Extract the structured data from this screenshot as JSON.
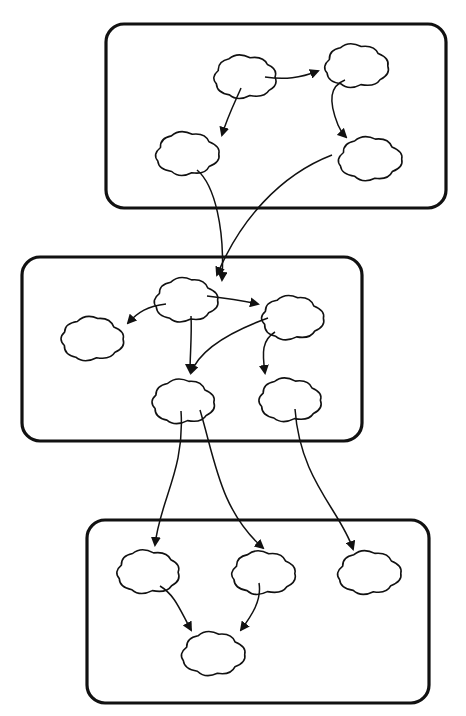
{
  "diagram": {
    "type": "layered-cloud-graph",
    "colors": {
      "stroke": "#111111",
      "background": "#ffffff"
    },
    "groups": [
      {
        "id": "top",
        "x": 106,
        "y": 24,
        "w": 340,
        "h": 184,
        "r": 18
      },
      {
        "id": "middle",
        "x": 22,
        "y": 257,
        "w": 340,
        "h": 184,
        "r": 18
      },
      {
        "id": "bottom",
        "x": 87,
        "y": 520,
        "w": 342,
        "h": 183,
        "r": 18
      }
    ],
    "nodes": [
      {
        "id": "t1",
        "group": "top",
        "cx": 245,
        "cy": 77,
        "rx": 35,
        "ry": 25
      },
      {
        "id": "t2",
        "group": "top",
        "cx": 356,
        "cy": 66,
        "rx": 35,
        "ry": 25
      },
      {
        "id": "t3",
        "group": "top",
        "cx": 187,
        "cy": 154,
        "rx": 35,
        "ry": 25
      },
      {
        "id": "t4",
        "group": "top",
        "cx": 370,
        "cy": 159,
        "rx": 35,
        "ry": 25
      },
      {
        "id": "m1",
        "group": "middle",
        "cx": 186,
        "cy": 300,
        "rx": 35,
        "ry": 25
      },
      {
        "id": "m2",
        "group": "middle",
        "cx": 292,
        "cy": 318,
        "rx": 35,
        "ry": 25
      },
      {
        "id": "m3",
        "group": "middle",
        "cx": 92,
        "cy": 339,
        "rx": 35,
        "ry": 25
      },
      {
        "id": "m4",
        "group": "middle",
        "cx": 183,
        "cy": 402,
        "rx": 35,
        "ry": 25
      },
      {
        "id": "m5",
        "group": "middle",
        "cx": 290,
        "cy": 400,
        "rx": 35,
        "ry": 25
      },
      {
        "id": "b1",
        "group": "bottom",
        "cx": 148,
        "cy": 572,
        "rx": 35,
        "ry": 25
      },
      {
        "id": "b2",
        "group": "bottom",
        "cx": 263,
        "cy": 573,
        "rx": 35,
        "ry": 25
      },
      {
        "id": "b3",
        "group": "bottom",
        "cx": 369,
        "cy": 573,
        "rx": 35,
        "ry": 25
      },
      {
        "id": "b4",
        "group": "bottom",
        "cx": 213,
        "cy": 654,
        "rx": 35,
        "ry": 25
      }
    ],
    "edges": [
      {
        "from": "t1",
        "to": "t2",
        "d": "M265,77 C285,80 300,78 318,71"
      },
      {
        "from": "t1",
        "to": "t3",
        "d": "M241,88 C236,100 228,115 222,135"
      },
      {
        "from": "t2",
        "to": "t4",
        "d": "M345,80 C330,86 328,100 338,125 C340,130 343,134 346,137"
      },
      {
        "from": "t3",
        "to": "m1",
        "d": "M197,170 C215,185 225,230 222,280"
      },
      {
        "from": "t4",
        "to": "m1",
        "d": "M332,155 C280,175 240,220 217,275"
      },
      {
        "from": "m1",
        "to": "m2",
        "d": "M207,296 C225,298 240,300 258,304"
      },
      {
        "from": "m1",
        "to": "m3",
        "d": "M166,304 C148,306 138,312 128,323"
      },
      {
        "from": "m1",
        "to": "m4",
        "d": "M191,316 C192,335 190,355 190,372"
      },
      {
        "from": "m2",
        "to": "m4",
        "d": "M268,318 C235,330 200,348 191,373"
      },
      {
        "from": "m2",
        "to": "m5",
        "d": "M275,332 C262,340 262,352 265,373"
      },
      {
        "from": "m4",
        "to": "b1",
        "d": "M181,411 C185,470 160,500 155,545"
      },
      {
        "from": "m4",
        "to": "b2",
        "d": "M200,410 C215,460 220,510 263,548"
      },
      {
        "from": "m5",
        "to": "b3",
        "d": "M295,409 C300,480 340,510 353,549"
      },
      {
        "from": "b1",
        "to": "b4",
        "d": "M160,586 C175,595 180,610 191,630"
      },
      {
        "from": "b2",
        "to": "b4",
        "d": "M259,583 C262,600 252,615 241,630"
      }
    ]
  }
}
